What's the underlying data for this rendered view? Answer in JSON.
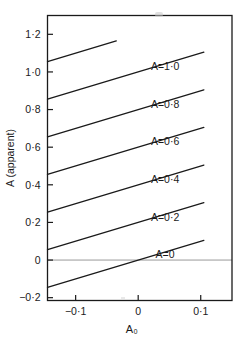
{
  "chart_data": {
    "type": "line",
    "title": "",
    "xlabel": "A₀",
    "ylabel": "A (apparent)",
    "xlim": [
      -0.145,
      0.15
    ],
    "ylim": [
      -0.215,
      1.3
    ],
    "grid": false,
    "legend": "inline-annotations",
    "xticks": [
      -0.1,
      0,
      0.1,
      0.2
    ],
    "xticklabels": [
      "−0·1",
      "0",
      "0·1",
      "0·2"
    ],
    "yticks": [
      -0.2,
      0,
      0.2,
      0.4,
      0.6,
      0.8,
      1.0,
      1.2
    ],
    "yticklabels": [
      "−0·2",
      "0",
      "0·2",
      "0·4",
      "0·6",
      "0·8",
      "1·0",
      "1·2"
    ],
    "zero_line": {
      "y": 0,
      "present": true
    },
    "series": [
      {
        "name": "A=0",
        "label": "A=0",
        "A": 0.0,
        "slope": 1.0,
        "intercept": 0.0,
        "x": [
          -0.145,
          0.105
        ],
        "y": [
          -0.145,
          0.105
        ]
      },
      {
        "name": "A=0.2",
        "label": "A=0·2",
        "A": 0.2,
        "slope": 1.0,
        "intercept": 0.2,
        "x": [
          -0.145,
          0.105
        ],
        "y": [
          0.055,
          0.305
        ]
      },
      {
        "name": "A=0.4",
        "label": "A=0·4",
        "A": 0.4,
        "slope": 1.0,
        "intercept": 0.4,
        "x": [
          -0.145,
          0.105
        ],
        "y": [
          0.255,
          0.505
        ]
      },
      {
        "name": "A=0.6",
        "label": "A=0·6",
        "A": 0.6,
        "slope": 1.0,
        "intercept": 0.6,
        "x": [
          -0.145,
          0.105
        ],
        "y": [
          0.455,
          0.705
        ]
      },
      {
        "name": "A=0.8",
        "label": "A=0·8",
        "A": 0.8,
        "slope": 1.0,
        "intercept": 0.8,
        "x": [
          -0.145,
          0.105
        ],
        "y": [
          0.655,
          0.905
        ]
      },
      {
        "name": "A=1.0",
        "label": "A=1·0",
        "A": 1.0,
        "slope": 1.0,
        "intercept": 1.0,
        "x": [
          -0.145,
          0.105
        ],
        "y": [
          0.855,
          1.105
        ]
      },
      {
        "name": "A=1.2",
        "label": "",
        "A": 1.2,
        "slope": 1.0,
        "intercept": 1.2,
        "x": [
          -0.145,
          -0.035
        ],
        "y": [
          1.055,
          1.165
        ]
      }
    ],
    "annotations": [
      {
        "text": "A=1·0",
        "x": 0.043,
        "y": 1.01
      },
      {
        "text": "A=0·8",
        "x": 0.043,
        "y": 0.81
      },
      {
        "text": "A=0·6",
        "x": 0.043,
        "y": 0.61
      },
      {
        "text": "A=0·4",
        "x": 0.043,
        "y": 0.41
      },
      {
        "text": "A=0·2",
        "x": 0.043,
        "y": 0.21
      },
      {
        "text": "A=0",
        "x": 0.043,
        "y": 0.01
      }
    ]
  },
  "axes": {
    "x_axis_label": "A₀",
    "y_axis_label": "A (apparent)"
  },
  "colors": {
    "line": "#1a1a1a",
    "frame": "#1a1a1a",
    "background": "#ffffff",
    "zero_line": "#8a8a8a"
  }
}
